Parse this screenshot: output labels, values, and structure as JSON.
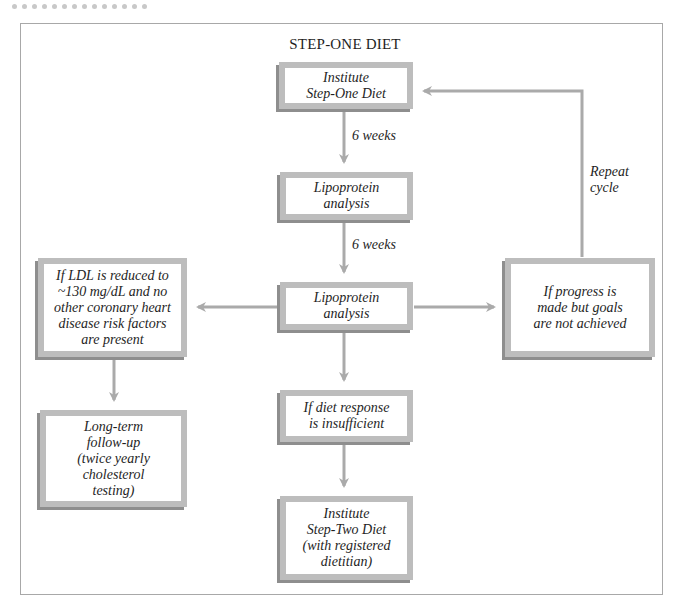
{
  "diagram": {
    "title": "STEP-ONE DIET",
    "colors": {
      "box_border": "#bdbdbd",
      "box_shadow": "#8e8e8e",
      "arrow": "#aaaaaa",
      "frame": "#a8a8a8",
      "text": "#1e1e1e"
    },
    "nodes": {
      "institute_step_one": "Institute\nStep-One Diet",
      "lipoprotein_1": "Lipoprotein\nanalysis",
      "lipoprotein_2": "Lipoprotein\nanalysis",
      "ldl_reduced": "If LDL is reduced to\n~130 mg/dL and no\nother coronary heart\ndisease risk factors\nare present",
      "progress_not_achieved": "If progress is\nmade but goals\nare not achieved",
      "diet_insufficient": "If diet response\nis insufficient",
      "long_term_followup": "Long-term\nfollow-up\n(twice yearly\ncholesterol\ntesting)",
      "institute_step_two": "Institute\nStep-Two Diet\n(with registered\ndietitian)"
    },
    "edge_labels": {
      "six_weeks_1": "6 weeks",
      "six_weeks_2": "6 weeks",
      "repeat_cycle": "Repeat\ncycle"
    },
    "edges": [
      {
        "from": "institute_step_one",
        "to": "lipoprotein_1",
        "label": "6 weeks"
      },
      {
        "from": "lipoprotein_1",
        "to": "lipoprotein_2",
        "label": "6 weeks"
      },
      {
        "from": "lipoprotein_2",
        "to": "ldl_reduced"
      },
      {
        "from": "lipoprotein_2",
        "to": "progress_not_achieved"
      },
      {
        "from": "lipoprotein_2",
        "to": "diet_insufficient"
      },
      {
        "from": "progress_not_achieved",
        "to": "institute_step_one",
        "label": "Repeat cycle"
      },
      {
        "from": "ldl_reduced",
        "to": "long_term_followup"
      },
      {
        "from": "diet_insufficient",
        "to": "institute_step_two"
      }
    ]
  }
}
